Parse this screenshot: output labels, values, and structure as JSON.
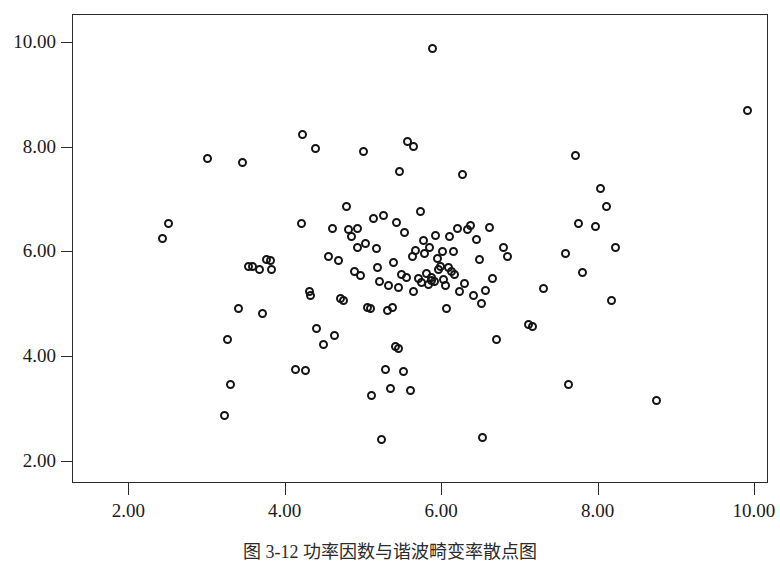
{
  "figure": {
    "caption": "图 3-12  功率因数与谐波畸变率散点图",
    "background_color": "#ffffff",
    "frame_color": "#2a2a2a",
    "marker_color": "#141414"
  },
  "chart_data": {
    "type": "scatter",
    "title": "",
    "xlabel": "",
    "ylabel": "",
    "xlim": [
      1.28,
      10.18
    ],
    "ylim": [
      1.58,
      10.53
    ],
    "xticks": [
      2.0,
      4.0,
      6.0,
      8.0,
      10.0
    ],
    "yticks": [
      2.0,
      4.0,
      6.0,
      8.0,
      10.0
    ],
    "xticklabels": [
      "2.00",
      "4.00",
      "6.00",
      "8.00",
      "10.00"
    ],
    "yticklabels": [
      "2.00",
      "4.00",
      "6.00",
      "8.00",
      "10.00"
    ],
    "grid": false,
    "legend": false,
    "marker": "open-circle",
    "marker_size": 9,
    "n_points": 126,
    "points": [
      [
        2.42,
        6.27
      ],
      [
        2.5,
        6.55
      ],
      [
        3.0,
        7.8
      ],
      [
        3.22,
        2.89
      ],
      [
        3.25,
        4.33
      ],
      [
        3.3,
        3.47
      ],
      [
        3.4,
        4.93
      ],
      [
        3.45,
        7.72
      ],
      [
        3.52,
        5.73
      ],
      [
        3.58,
        5.74
      ],
      [
        3.66,
        5.68
      ],
      [
        3.7,
        4.83
      ],
      [
        3.76,
        5.86
      ],
      [
        3.8,
        5.85
      ],
      [
        3.82,
        5.67
      ],
      [
        4.12,
        3.76
      ],
      [
        4.2,
        6.55
      ],
      [
        4.22,
        8.25
      ],
      [
        4.25,
        3.74
      ],
      [
        4.3,
        5.26
      ],
      [
        4.32,
        5.18
      ],
      [
        4.38,
        7.99
      ],
      [
        4.4,
        4.55
      ],
      [
        4.48,
        4.25
      ],
      [
        4.55,
        5.93
      ],
      [
        4.6,
        6.45
      ],
      [
        4.62,
        4.42
      ],
      [
        4.68,
        5.84
      ],
      [
        4.7,
        5.12
      ],
      [
        4.74,
        5.09
      ],
      [
        4.78,
        6.88
      ],
      [
        4.8,
        6.43
      ],
      [
        4.84,
        6.31
      ],
      [
        4.88,
        5.63
      ],
      [
        4.92,
        6.45
      ],
      [
        4.95,
        5.55
      ],
      [
        5.0,
        7.92
      ],
      [
        5.02,
        6.17
      ],
      [
        5.05,
        4.94
      ],
      [
        5.08,
        4.93
      ],
      [
        5.1,
        3.26
      ],
      [
        5.12,
        6.64
      ],
      [
        5.16,
        6.08
      ],
      [
        5.2,
        5.45
      ],
      [
        5.22,
        2.42
      ],
      [
        5.25,
        6.71
      ],
      [
        5.28,
        3.77
      ],
      [
        5.3,
        4.9
      ],
      [
        5.32,
        5.36
      ],
      [
        5.34,
        3.4
      ],
      [
        5.38,
        5.81
      ],
      [
        5.4,
        4.2
      ],
      [
        5.42,
        6.57
      ],
      [
        5.44,
        4.16
      ],
      [
        5.46,
        7.55
      ],
      [
        5.48,
        5.58
      ],
      [
        5.5,
        3.72
      ],
      [
        5.52,
        6.38
      ],
      [
        5.56,
        8.11
      ],
      [
        5.6,
        3.37
      ],
      [
        5.62,
        5.92
      ],
      [
        5.64,
        8.02
      ],
      [
        5.66,
        6.04
      ],
      [
        5.7,
        5.5
      ],
      [
        5.72,
        6.78
      ],
      [
        5.74,
        5.42
      ],
      [
        5.76,
        6.22
      ],
      [
        5.78,
        5.97
      ],
      [
        5.8,
        5.6
      ],
      [
        5.82,
        5.38
      ],
      [
        5.84,
        6.1
      ],
      [
        5.86,
        5.52
      ],
      [
        5.88,
        9.9
      ],
      [
        5.9,
        5.44
      ],
      [
        5.92,
        6.33
      ],
      [
        5.94,
        5.88
      ],
      [
        5.96,
        5.68
      ],
      [
        6.0,
        6.02
      ],
      [
        6.02,
        5.48
      ],
      [
        6.06,
        4.93
      ],
      [
        6.1,
        6.3
      ],
      [
        6.12,
        5.63
      ],
      [
        6.16,
        5.57
      ],
      [
        6.2,
        6.46
      ],
      [
        6.22,
        5.26
      ],
      [
        6.26,
        7.48
      ],
      [
        6.28,
        5.4
      ],
      [
        6.32,
        6.44
      ],
      [
        6.36,
        6.52
      ],
      [
        6.4,
        5.18
      ],
      [
        6.44,
        6.25
      ],
      [
        6.48,
        5.87
      ],
      [
        6.5,
        5.02
      ],
      [
        6.52,
        2.47
      ],
      [
        6.56,
        5.28
      ],
      [
        6.6,
        6.48
      ],
      [
        6.64,
        5.5
      ],
      [
        6.7,
        4.34
      ],
      [
        6.78,
        6.1
      ],
      [
        6.84,
        5.92
      ],
      [
        7.1,
        4.63
      ],
      [
        7.16,
        4.58
      ],
      [
        7.3,
        5.32
      ],
      [
        7.58,
        5.98
      ],
      [
        7.62,
        3.47
      ],
      [
        7.7,
        7.84
      ],
      [
        7.74,
        6.55
      ],
      [
        7.8,
        5.62
      ],
      [
        7.96,
        6.5
      ],
      [
        8.02,
        7.21
      ],
      [
        8.1,
        6.88
      ],
      [
        8.16,
        5.08
      ],
      [
        8.22,
        6.1
      ],
      [
        8.74,
        3.18
      ],
      [
        9.9,
        8.7
      ],
      [
        4.92,
        6.1
      ],
      [
        5.18,
        5.72
      ],
      [
        5.36,
        4.94
      ],
      [
        5.98,
        5.74
      ],
      [
        6.08,
        5.72
      ],
      [
        6.14,
        6.02
      ],
      [
        5.54,
        5.52
      ],
      [
        5.86,
        5.46
      ],
      [
        6.04,
        5.36
      ],
      [
        5.44,
        5.33
      ],
      [
        5.64,
        5.26
      ]
    ]
  }
}
